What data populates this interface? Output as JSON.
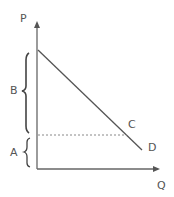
{
  "diagram": {
    "axes": {
      "y_label": "P",
      "x_label": "Q"
    },
    "curve_labels": {
      "upper": "C",
      "lower": "D"
    },
    "brackets": {
      "upper": "B",
      "lower": "A"
    },
    "colors": {
      "line": "#555555",
      "axis": "#666666",
      "dashed": "#777777",
      "text": "#555555"
    }
  }
}
